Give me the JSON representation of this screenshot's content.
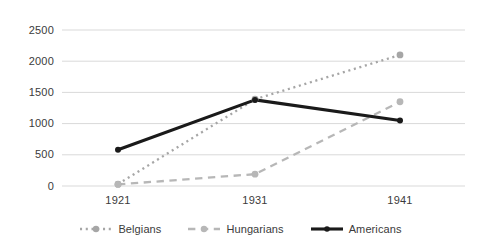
{
  "chart_data": {
    "type": "line",
    "title": "",
    "subtitle": "",
    "xlabel": "",
    "ylabel": "",
    "categories": [
      "1921",
      "1931",
      "1941"
    ],
    "x": [
      1921,
      1931,
      1941
    ],
    "series": [
      {
        "name": "Belgians",
        "values": [
          30,
          1390,
          2100
        ],
        "style": "dotted",
        "color": "#a6a6a6",
        "marker": "circle"
      },
      {
        "name": "Hungarians",
        "values": [
          25,
          190,
          1350
        ],
        "style": "dashed",
        "color": "#b7b7b7",
        "marker": "circle"
      },
      {
        "name": "Americans",
        "values": [
          580,
          1380,
          1050
        ],
        "style": "solid",
        "color": "#1a1a1a",
        "marker": "circle"
      }
    ],
    "ylim": [
      0,
      2500
    ],
    "yticks": [
      0,
      500,
      1000,
      1500,
      2000,
      2500
    ],
    "ytick_labels": [
      "0",
      "500",
      "1000",
      "1500",
      "2000",
      "2500"
    ],
    "xtick_labels": [
      "1921",
      "1931",
      "1941"
    ],
    "grid": true,
    "grid_axis": "y",
    "grid_color": "#d9d9d9",
    "legend_position": "bottom",
    "background": "#ffffff"
  },
  "legend": {
    "entries": [
      {
        "label": "Belgians"
      },
      {
        "label": "Hungarians"
      },
      {
        "label": "Americans"
      }
    ]
  }
}
